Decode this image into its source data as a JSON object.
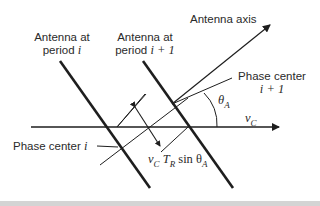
{
  "labels": {
    "antenna_i_line1": "Antenna at",
    "antenna_i_line2": "period ",
    "antenna_i_var": "i",
    "antenna_i1_line1": "Antenna at",
    "antenna_i1_line2": "period ",
    "antenna_i1_var": "i + 1",
    "antenna_axis": "Antenna axis",
    "phase_center_i1_line1": "Phase center",
    "phase_center_i1_line2": "i + 1",
    "phase_center_i": "Phase center ",
    "phase_center_i_var": "i",
    "theta": "θ",
    "theta_sub": "A",
    "velocity": "v",
    "velocity_sub": "C",
    "baseline_v": "v",
    "baseline_v_sub": "C",
    "baseline_T": "T",
    "baseline_T_sub": "R",
    "baseline_sin": " sin θ",
    "baseline_sin_sub": "A"
  },
  "colors": {
    "line": "#1e1e1e",
    "text": "#2a2a2a",
    "footer": "#d4d4d4"
  }
}
